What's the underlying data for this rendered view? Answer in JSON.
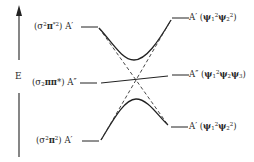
{
  "diagram": {
    "type": "state-correlation-diagram",
    "axis": {
      "label": "E",
      "direction": "up"
    },
    "left_states": [
      {
        "config": "(σ²π*²)",
        "symmetry": "A′",
        "level": "top"
      },
      {
        "config": "(σ₂ππ*)",
        "symmetry": "A″",
        "level": "middle"
      },
      {
        "config": "(σ²π²)",
        "symmetry": "A′",
        "level": "bottom"
      }
    ],
    "right_states": [
      {
        "symmetry": "A′",
        "config": "(ψ₁²ψ₂²)",
        "level": "top"
      },
      {
        "symmetry": "A″",
        "config": "(ψ₁²ψ₂ψ₃)",
        "level": "middle"
      },
      {
        "symmetry": "A′",
        "config": "(ψ₁²ψ₂²)",
        "level": "bottom"
      }
    ],
    "connections": [
      {
        "from": "left-top",
        "to": "right-top",
        "style": "solid-avoided-crossing-upper"
      },
      {
        "from": "left-bottom",
        "to": "right-bottom",
        "style": "solid-avoided-crossing-lower"
      },
      {
        "from": "left-middle",
        "to": "right-middle",
        "style": "solid"
      },
      {
        "from": "left-top",
        "to": "right-bottom",
        "style": "dashed"
      },
      {
        "from": "left-bottom",
        "to": "right-top",
        "style": "dashed"
      }
    ],
    "colors": {
      "line": "#222222",
      "background": "#ffffff"
    }
  },
  "labels": {
    "axis_E": "E",
    "left_top_sym": "A′",
    "left_mid_sym": "A″",
    "left_bot_sym": "A′",
    "right_top_sym": "A′",
    "right_mid_sym": "A″",
    "right_bot_sym": "A′"
  }
}
